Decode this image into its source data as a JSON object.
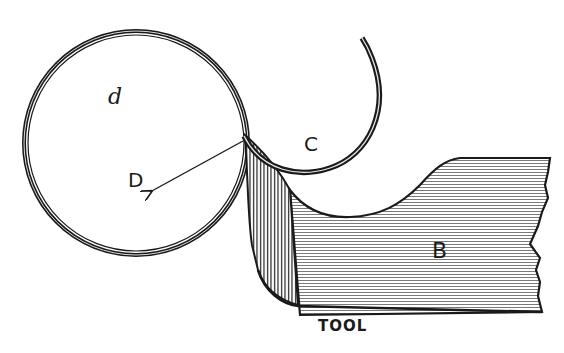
{
  "diagram": {
    "type": "engraving-illustration",
    "labels": {
      "work_circle": "d",
      "radius_point": "D",
      "chip": "C",
      "tool_body": "B",
      "tool_caption": "TOOL"
    },
    "colors": {
      "ink": "#1a1a1a",
      "background": "#ffffff",
      "hatch": "#555555"
    }
  }
}
